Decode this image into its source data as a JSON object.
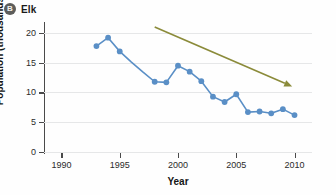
{
  "panel": {
    "badge": "B",
    "title": "Elk"
  },
  "chart_data": {
    "type": "line",
    "title": "Elk",
    "xlabel": "Year",
    "ylabel": "Population (thousands)",
    "xlim": [
      1988.5,
      2011.5
    ],
    "ylim": [
      0,
      21.5
    ],
    "xticks": [
      1990,
      1995,
      2000,
      2005,
      2010
    ],
    "yticks": [
      0,
      5,
      10,
      15,
      20
    ],
    "grid": true,
    "legend": "none",
    "series": [
      {
        "name": "Elk population",
        "color": "#5a8fc6",
        "marker": "circle",
        "x": [
          1993,
          1994,
          1995,
          1996,
          1997,
          1998,
          1999,
          2000,
          2001,
          2002,
          2003,
          2004,
          2005,
          2006,
          2007,
          2008,
          2009,
          2010
        ],
        "values": [
          17.8,
          19.2,
          16.9,
          15.1,
          13.4,
          11.8,
          11.7,
          14.5,
          13.5,
          11.9,
          9.3,
          8.4,
          9.7,
          6.7,
          6.8,
          6.5,
          7.2,
          6.2
        ]
      }
    ],
    "annotations": [
      {
        "type": "arrow",
        "label": "declining-trend-arrow",
        "color": "#8b8b3a",
        "x_start": 1998.0,
        "y_start": 21.0,
        "x_end": 2009.8,
        "y_end": 11.0
      }
    ]
  }
}
